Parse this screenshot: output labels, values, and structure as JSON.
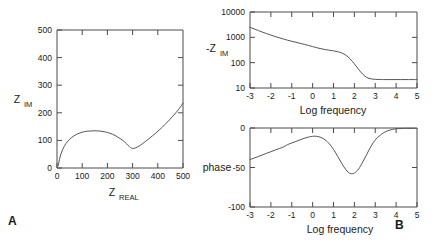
{
  "figure": {
    "panels": [
      {
        "letter": "A",
        "name": "nyquist-panel"
      },
      {
        "letter": "B",
        "name": "bode-panel"
      }
    ]
  },
  "chart_data": [
    {
      "type": "line",
      "name": "nyquist-plot",
      "panel": "A",
      "title": "",
      "xlabel": "Z",
      "xlabel_sub": "REAL",
      "ylabel": "Z",
      "ylabel_sub": "IM",
      "xlim": [
        0,
        500
      ],
      "ylim": [
        0,
        500
      ],
      "xticks": [
        0,
        100,
        200,
        300,
        400,
        500
      ],
      "yticks": [
        0,
        100,
        200,
        300,
        400,
        500
      ],
      "xticklabels": [
        "0",
        "100",
        "200",
        "300",
        "400",
        "500"
      ],
      "yticklabels": [
        "0",
        "100",
        "200",
        "300",
        "400",
        "500"
      ],
      "grid": false,
      "legend": "none",
      "x": [
        5,
        12,
        22,
        35,
        50,
        68,
        88,
        110,
        130,
        150,
        170,
        190,
        210,
        230,
        250,
        268,
        282,
        292,
        300,
        312,
        330,
        352,
        378,
        405,
        432,
        460,
        485,
        500
      ],
      "y": [
        8,
        40,
        66,
        88,
        104,
        117,
        126,
        132,
        134,
        135,
        134,
        131,
        126,
        118,
        107,
        95,
        82,
        74,
        71,
        73,
        82,
        97,
        116,
        137,
        161,
        188,
        215,
        235
      ]
    },
    {
      "type": "line",
      "name": "bode-magnitude-plot",
      "panel": "B",
      "title": "",
      "xlabel": "Log frequency",
      "ylabel": "-Z",
      "ylabel_sub": "IM",
      "yscale": "log",
      "xlim": [
        -3,
        5
      ],
      "ylim": [
        10,
        10000
      ],
      "xticks": [
        -3,
        -2,
        -1,
        0,
        1,
        2,
        3,
        4,
        5
      ],
      "yticks": [
        10,
        100,
        1000,
        10000
      ],
      "xticklabels": [
        "-3",
        "-2",
        "-1",
        "0",
        "1",
        "2",
        "3",
        "4",
        "5"
      ],
      "yticklabels": [
        "10",
        "100",
        "1000",
        "10000"
      ],
      "grid": false,
      "legend": "none",
      "x": [
        -3.0,
        -2.8,
        -2.6,
        -2.4,
        -2.2,
        -2.0,
        -1.8,
        -1.6,
        -1.4,
        -1.2,
        -1.0,
        -0.8,
        -0.6,
        -0.4,
        -0.2,
        0.0,
        0.2,
        0.4,
        0.6,
        0.8,
        1.0,
        1.2,
        1.4,
        1.6,
        1.8,
        2.0,
        2.2,
        2.4,
        2.6,
        2.8,
        3.0,
        3.4,
        3.8,
        4.2,
        4.6,
        5.0
      ],
      "y": [
        2500,
        2150,
        1850,
        1600,
        1400,
        1230,
        1080,
        960,
        860,
        770,
        700,
        640,
        580,
        530,
        480,
        430,
        390,
        355,
        330,
        310,
        292,
        272,
        240,
        195,
        140,
        90,
        55,
        35,
        26,
        23,
        22,
        21.5,
        21.5,
        21.5,
        21.5,
        21.5
      ]
    },
    {
      "type": "line",
      "name": "bode-phase-plot",
      "panel": "B",
      "title": "",
      "xlabel": "Log frequency",
      "ylabel": "phase",
      "xlim": [
        -3,
        5
      ],
      "ylim": [
        -100,
        0
      ],
      "xticks": [
        -3,
        -2,
        -1,
        0,
        1,
        2,
        3,
        4,
        5
      ],
      "yticks": [
        -100,
        -50,
        0
      ],
      "xticklabels": [
        "-3",
        "-2",
        "-1",
        "0",
        "1",
        "2",
        "3",
        "4",
        "5"
      ],
      "yticklabels": [
        "-100",
        "-50",
        "0"
      ],
      "grid": false,
      "legend": "none",
      "x": [
        -3.0,
        -2.8,
        -2.6,
        -2.4,
        -2.2,
        -2.0,
        -1.8,
        -1.6,
        -1.4,
        -1.2,
        -1.0,
        -0.8,
        -0.6,
        -0.4,
        -0.2,
        0.0,
        0.2,
        0.4,
        0.6,
        0.8,
        1.0,
        1.2,
        1.4,
        1.6,
        1.8,
        2.0,
        2.2,
        2.4,
        2.6,
        2.8,
        3.0,
        3.2,
        3.4,
        3.6,
        3.8,
        4.0,
        4.4,
        4.8,
        5.0
      ],
      "y": [
        -40,
        -38,
        -36,
        -34,
        -32,
        -30,
        -28,
        -26,
        -24,
        -21,
        -19,
        -17,
        -15,
        -13,
        -11.5,
        -10.5,
        -10.5,
        -12,
        -15,
        -20,
        -27,
        -36,
        -45,
        -53,
        -57.5,
        -57,
        -52,
        -43,
        -33,
        -23,
        -15,
        -10,
        -6,
        -3.5,
        -2,
        -1,
        -0.5,
        -0.5,
        -0.5
      ]
    }
  ]
}
